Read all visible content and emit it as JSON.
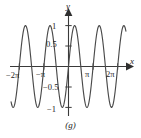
{
  "figure": {
    "caption": "(g)",
    "axis_labels": {
      "x": "x",
      "y": "y"
    },
    "colors": {
      "curve": "#4a4a4a",
      "axis": "#3a3a3a",
      "text": "#242424",
      "background": "#ffffff"
    }
  },
  "chart_data": {
    "type": "line",
    "title": "",
    "subtitle": "",
    "xlabel": "x",
    "ylabel": "y",
    "xlim": [
      -7.3304,
      7.3304
    ],
    "ylim": [
      -1.25,
      1.25
    ],
    "grid": false,
    "legend": null,
    "function": "y = sin(2x)",
    "amplitude": 1,
    "period": 3.1416,
    "x_ticks": [
      {
        "value": -6.2832,
        "label": "−2π"
      },
      {
        "value": -3.1416,
        "label": "−π"
      },
      {
        "value": 3.1416,
        "label": "π"
      },
      {
        "value": 6.2832,
        "label": "2π"
      }
    ],
    "y_ticks": [
      {
        "value": 1,
        "label": "1"
      },
      {
        "value": 0.5,
        "label": "0.5"
      },
      {
        "value": -0.5,
        "label": "−0.5"
      },
      {
        "value": -1,
        "label": "−1"
      }
    ],
    "series": [
      {
        "name": "sin(2x)",
        "x": [
          -7.3304,
          -7.0805,
          -6.8307,
          -6.5808,
          -6.331,
          -6.0811,
          -5.8312,
          -5.5814,
          -5.3315,
          -5.0817,
          -4.8318,
          -4.5819,
          -4.3321,
          -4.0822,
          -3.8324,
          -3.5825,
          -3.3326,
          -3.0828,
          -2.8329,
          -2.5831,
          -2.3332,
          -2.0833,
          -1.8335,
          -1.5836,
          -1.3338,
          -1.0839,
          -0.834,
          -0.5842,
          -0.3343,
          -0.0845,
          0.1654,
          0.4152,
          0.6651,
          0.915,
          1.1648,
          1.4147,
          1.6645,
          1.9144,
          2.1643,
          2.4141,
          2.664,
          2.9138,
          3.1637,
          3.4136,
          3.6634,
          3.9133,
          4.1631,
          4.413,
          4.6629,
          4.9127,
          5.1626,
          5.4124,
          5.6623,
          5.9122,
          6.162,
          6.4119,
          6.6617,
          6.9116,
          7.1615,
          7.3304
        ],
        "y": [
          0.9239,
          0.7071,
          0.3827,
          0.0,
          -0.3827,
          -0.7071,
          -0.9239,
          -1.0,
          -0.9239,
          -0.7071,
          -0.3827,
          0.0,
          0.3827,
          0.7071,
          0.9239,
          1.0,
          0.9239,
          0.7071,
          0.3827,
          0.0,
          -0.3827,
          -0.7071,
          -0.9239,
          -1.0,
          -0.9239,
          -0.7071,
          -0.3827,
          0.0,
          0.3827,
          0.7071,
          0.9239,
          1.0,
          0.9239,
          0.7071,
          0.3827,
          0.0,
          -0.3827,
          -0.7071,
          -0.9239,
          -1.0,
          -0.9239,
          -0.7071,
          -0.3827,
          0.0,
          0.3827,
          0.7071,
          0.9239,
          1.0,
          0.9239,
          0.7071,
          0.3827,
          0.0,
          -0.3827,
          -0.7071,
          -0.9239,
          -1.0,
          -0.9239,
          -0.7071,
          -0.3827,
          0.0
        ]
      }
    ]
  }
}
